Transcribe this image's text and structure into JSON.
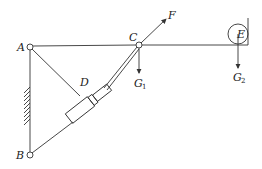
{
  "diagram": {
    "type": "mechanism",
    "labels": {
      "A": "A",
      "B": "B",
      "C": "C",
      "D": "D",
      "E": "E",
      "F": "F",
      "G1": "G",
      "G1_sub": "1",
      "G2": "G",
      "G2_sub": "2"
    },
    "colors": {
      "line": "#333333",
      "text": "#222222",
      "background": "#ffffff"
    }
  }
}
